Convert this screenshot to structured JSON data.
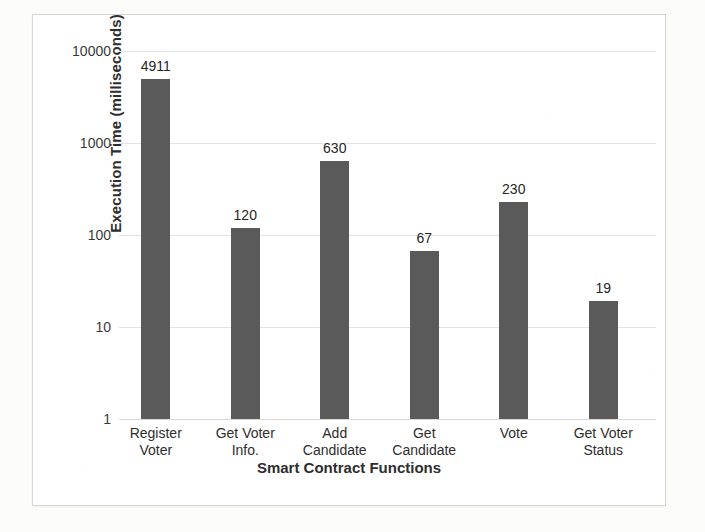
{
  "chart_data": {
    "type": "bar",
    "title": "",
    "xlabel": "Smart Contract Functions",
    "ylabel": "Execution Time (milliseconds)",
    "categories": [
      "Register Voter",
      "Get Voter Info.",
      "Add Candidate",
      "Get Candidate",
      "Vote",
      "Get Voter Status"
    ],
    "category_lines": [
      [
        "Register",
        "Voter"
      ],
      [
        "Get Voter",
        "Info."
      ],
      [
        "Add",
        "Candidate"
      ],
      [
        "Get",
        "Candidate"
      ],
      [
        "Vote",
        ""
      ],
      [
        "Get Voter",
        "Status"
      ]
    ],
    "values": [
      4911,
      120,
      630,
      67,
      230,
      19
    ],
    "value_labels": [
      "4911",
      "120",
      "630",
      "67",
      "230",
      "19"
    ],
    "yscale": "log",
    "ylim": [
      1,
      10000
    ],
    "yticks": [
      10000,
      1000,
      100,
      10,
      1
    ],
    "ytick_labels": [
      "10000",
      "1000",
      "100",
      "10",
      "1"
    ],
    "grid": true,
    "legend": false,
    "bar_color": "#5a5a5a",
    "gridline_color": "#e3e3e3",
    "text_color": "#2e2e2e"
  }
}
